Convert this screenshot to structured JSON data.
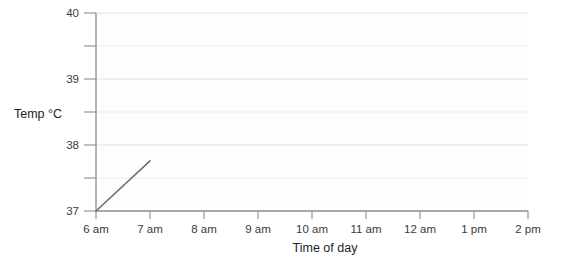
{
  "chart_data": {
    "type": "line",
    "title": "",
    "xlabel": "Time of day",
    "ylabel": "Temp °C",
    "x_categories": [
      "6 am",
      "7 am",
      "8 am",
      "9 am",
      "10 am",
      "11 am",
      "12 am",
      "1 pm",
      "2 pm"
    ],
    "x_values": [
      6,
      7,
      8,
      9,
      10,
      11,
      12,
      13,
      14
    ],
    "xlim": [
      6,
      14
    ],
    "ylim": [
      37,
      40
    ],
    "y_ticks_major": [
      37,
      38,
      39,
      40
    ],
    "y_ticks_minor": [
      37.5,
      38.5,
      39.5
    ],
    "y_tick_labels": [
      "37",
      "38",
      "39",
      "40"
    ],
    "grid": "horizontal",
    "legend": "none",
    "series": [
      {
        "name": "Temperature",
        "color": "#6f6f6f",
        "points": [
          {
            "x": 6,
            "y": 37.0
          },
          {
            "x": 7,
            "y": 37.76
          }
        ]
      }
    ]
  },
  "axes": {
    "y_axis_label": "Temp °C",
    "x_axis_label": "Time of day"
  },
  "colors": {
    "line": "#6f6f6f",
    "axis": "#8c8c8c",
    "grid": "#e2e2e2",
    "text": "#2b2b2b",
    "background": "#ffffff"
  }
}
